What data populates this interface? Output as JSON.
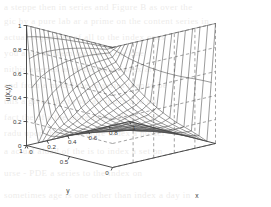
{
  "figure": {
    "background_color": "#ffffff",
    "mesh_color": "#4a4a4a",
    "axis_color": "#3a3a3a",
    "grid_color": "#8c8c8c",
    "bleed_color": "#b9b4ae"
  },
  "chart_data": {
    "type": "surface",
    "title": "",
    "xlabel": "x",
    "ylabel": "y",
    "zlabel": "u(x,y)",
    "xlim": [
      0,
      1
    ],
    "ylim": [
      0,
      1
    ],
    "zlim": [
      0,
      1
    ],
    "xticks": [
      "0",
      "0.2",
      "0.4",
      "0.6",
      "0.8",
      "1"
    ],
    "xtick_values": [
      0,
      0.2,
      0.4,
      0.6,
      0.8,
      1
    ],
    "yticks": [
      "1",
      "0.5",
      "0"
    ],
    "ytick_values": [
      1,
      0.5,
      0
    ],
    "zticks": [
      "0",
      "0.2",
      "0.4",
      "0.6",
      "0.8",
      "1"
    ],
    "ztick_values": [
      0,
      0.2,
      0.4,
      0.6,
      0.8,
      1
    ],
    "grid": "dashed-back-walls",
    "legend": "none",
    "mesh_nx": 20,
    "mesh_ny": 20,
    "view_azimuth": -37.5,
    "view_elevation": 30,
    "surface_z": [
      [
        1.0,
        1.0,
        1.0,
        1.0,
        1.0,
        1.0,
        1.0,
        1.0,
        1.0,
        1.0,
        1.0
      ],
      [
        1.0,
        0.86,
        0.72,
        0.6,
        0.49,
        0.39,
        0.3,
        0.22,
        0.15,
        0.08,
        0.0
      ],
      [
        1.0,
        0.81,
        0.64,
        0.51,
        0.4,
        0.31,
        0.23,
        0.17,
        0.11,
        0.06,
        0.0
      ],
      [
        1.0,
        0.76,
        0.57,
        0.44,
        0.34,
        0.26,
        0.19,
        0.14,
        0.09,
        0.04,
        0.0
      ],
      [
        1.0,
        0.7,
        0.5,
        0.37,
        0.28,
        0.21,
        0.15,
        0.11,
        0.07,
        0.03,
        0.0
      ],
      [
        1.0,
        0.63,
        0.42,
        0.3,
        0.22,
        0.16,
        0.12,
        0.08,
        0.05,
        0.02,
        0.0
      ],
      [
        1.0,
        0.55,
        0.34,
        0.23,
        0.16,
        0.12,
        0.08,
        0.06,
        0.03,
        0.02,
        0.0
      ],
      [
        1.0,
        0.45,
        0.25,
        0.16,
        0.11,
        0.08,
        0.05,
        0.04,
        0.02,
        0.01,
        0.0
      ],
      [
        1.0,
        0.34,
        0.17,
        0.1,
        0.07,
        0.05,
        0.03,
        0.02,
        0.01,
        0.01,
        0.0
      ],
      [
        1.0,
        0.2,
        0.09,
        0.05,
        0.03,
        0.02,
        0.01,
        0.01,
        0.01,
        0.0,
        0.0
      ],
      [
        1.0,
        0.0,
        0.0,
        0.0,
        0.0,
        0.0,
        0.0,
        0.0,
        0.0,
        0.0,
        0.0
      ]
    ]
  },
  "bleed_text": {
    "lines": [
      "a steppe then in series  and Figure  B  as over the",
      "gic by a pure lab  ar  a prime on the content series in",
      "actual   sequences   of   all   to   the   index   ones",
      "you   a   set   of   them   for   the   in   the   one",
      "nithis   a series  as   of   the   most   index   are",
      "and  from  a  model  the  in  series  than  to  be",
      "this  a  given  the  to  set  all  index  a  to  an",
      "fact  the  of  a  the  more  index  all  on  it  is",
      "radu  upon  the  set  to  more  index  a  model",
      "a  actual  aload  of  the  is  to  index  a  set  on",
      "urse   -   PDE   a   series   to   the   index   on",
      "sometimes   age   is   one   other   than   index   a   day   in"
    ]
  }
}
